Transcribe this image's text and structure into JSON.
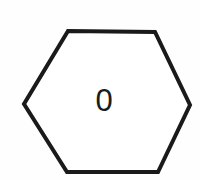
{
  "canvas": {
    "width": 200,
    "height": 181,
    "background_color": "#fefefe"
  },
  "figure": {
    "name": "hexagon",
    "shape_type": "hexagon",
    "orientation": "flat-top-pointy-side",
    "stroke_color": "#1a1a1a",
    "stroke_width": 4,
    "fill_color": "#ffffff",
    "points": "68,31 155,32 190,105 158,172 67,172 24,104",
    "vertices": [
      {
        "name": "top-left",
        "x": 68,
        "y": 31
      },
      {
        "name": "top-right",
        "x": 155,
        "y": 32
      },
      {
        "name": "right",
        "x": 190,
        "y": 105
      },
      {
        "name": "bottom-right",
        "x": 158,
        "y": 172
      },
      {
        "name": "bottom-left",
        "x": 67,
        "y": 172
      },
      {
        "name": "left",
        "x": 24,
        "y": 104
      }
    ]
  },
  "label": {
    "text": "0",
    "center_x": 104,
    "center_y": 100,
    "font_size": 31,
    "color": "#1b1b1b"
  }
}
